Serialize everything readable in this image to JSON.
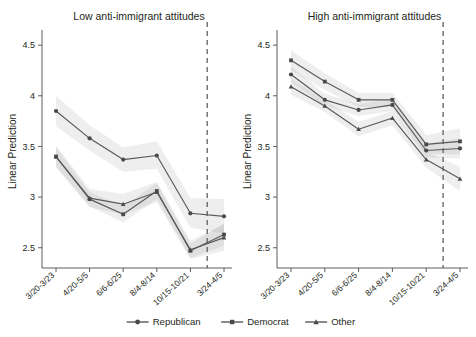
{
  "figure": {
    "ylabel": "Linear Prediction",
    "legend_position": "bottom-center"
  },
  "chart_data": {
    "type": "line",
    "title": "",
    "xlabel": "",
    "ylabel": "Linear Prediction",
    "ylim": [
      2.3,
      4.6
    ],
    "yticks": [
      2.5,
      3,
      3.5,
      4,
      4.5
    ],
    "ytick_labels": [
      "2.5",
      "3",
      "3.5",
      "4",
      "4.5"
    ],
    "categories": [
      "3/20-3/23",
      "4/20-5/5",
      "6/6-6/25",
      "8/4-8/14",
      "10/15-10/21",
      "3/24-4/5"
    ],
    "grid": false,
    "legend": [
      "Republican",
      "Democrat",
      "Other"
    ],
    "markers": [
      "circle",
      "square",
      "triangle"
    ],
    "reference_line": {
      "type": "vertical-dashed",
      "between_categories": [
        "10/15-10/21",
        "3/24-4/5"
      ]
    },
    "panels": [
      {
        "title": "Low anti-immigrant attitudes",
        "series": [
          {
            "name": "Republican",
            "marker": "circle",
            "values": [
              3.85,
              3.58,
              3.37,
              3.41,
              2.84,
              2.81
            ],
            "ci_low": [
              3.7,
              3.46,
              3.25,
              3.28,
              2.7,
              2.64
            ],
            "ci_high": [
              4.0,
              3.71,
              3.49,
              3.55,
              2.99,
              2.98
            ]
          },
          {
            "name": "Democrat",
            "marker": "square",
            "values": [
              3.4,
              2.98,
              2.83,
              3.06,
              2.47,
              2.63
            ],
            "ci_low": [
              3.31,
              2.91,
              2.75,
              2.98,
              2.4,
              2.52
            ],
            "ci_high": [
              3.49,
              3.05,
              2.91,
              3.14,
              2.54,
              2.74
            ]
          },
          {
            "name": "Other",
            "marker": "triangle",
            "values": [
              3.4,
              2.99,
              2.93,
              3.05,
              2.48,
              2.6
            ],
            "ci_low": [
              3.29,
              2.9,
              2.83,
              2.95,
              2.39,
              2.47
            ],
            "ci_high": [
              3.51,
              3.08,
              3.03,
              3.15,
              2.57,
              2.73
            ]
          }
        ]
      },
      {
        "title": "High anti-immigrant attitudes",
        "series": [
          {
            "name": "Republican",
            "marker": "circle",
            "values": [
              4.21,
              3.96,
              3.86,
              3.91,
              3.46,
              3.48
            ],
            "ci_low": [
              4.13,
              3.9,
              3.8,
              3.85,
              3.39,
              3.38
            ],
            "ci_high": [
              4.29,
              4.02,
              3.92,
              3.97,
              3.53,
              3.58
            ]
          },
          {
            "name": "Democrat",
            "marker": "square",
            "values": [
              4.35,
              4.14,
              3.96,
              3.96,
              3.52,
              3.55
            ],
            "ci_low": [
              4.25,
              4.06,
              3.89,
              3.89,
              3.43,
              3.42
            ],
            "ci_high": [
              4.45,
              4.22,
              4.03,
              4.03,
              3.61,
              3.68
            ]
          },
          {
            "name": "Other",
            "marker": "triangle",
            "values": [
              4.09,
              3.9,
              3.67,
              3.78,
              3.37,
              3.18
            ],
            "ci_low": [
              4.01,
              3.84,
              3.6,
              3.71,
              3.29,
              3.06
            ],
            "ci_high": [
              4.17,
              3.96,
              3.74,
              3.85,
              3.45,
              3.3
            ]
          }
        ]
      }
    ]
  }
}
